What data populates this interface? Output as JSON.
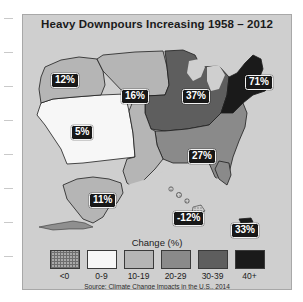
{
  "figure": {
    "title": "Heavy Downpours Increasing 1958 – 2012",
    "source": "Source: Climate Change Impacts in the U.S., 2014",
    "legend_title": "Change (%)",
    "panel_bg": "#cfcfcf"
  },
  "legend": {
    "bins": [
      {
        "label": "<0",
        "color": "#a9a9a9",
        "pattern": "stipple"
      },
      {
        "label": "0-9",
        "color": "#f7f7f7",
        "pattern": "solid"
      },
      {
        "label": "10-19",
        "color": "#b5b5b5",
        "pattern": "solid"
      },
      {
        "label": "20-29",
        "color": "#8a8a8a",
        "pattern": "solid"
      },
      {
        "label": "30-39",
        "color": "#5e5e5e",
        "pattern": "solid"
      },
      {
        "label": "40+",
        "color": "#1a1a1a",
        "pattern": "solid"
      }
    ]
  },
  "chart_data": {
    "type": "map",
    "title": "Heavy Downpours Increasing 1958 – 2012",
    "subtitle": "",
    "xlabel": "",
    "ylabel": "",
    "value_unit": "%",
    "value_label": "Change (%)",
    "legend_position": "bottom",
    "grid": false,
    "bins": [
      "<0",
      "0-9",
      "10-19",
      "20-29",
      "30-39",
      "40+"
    ],
    "bin_colors": [
      "#a9a9a9",
      "#f7f7f7",
      "#b5b5b5",
      "#8a8a8a",
      "#5e5e5e",
      "#1a1a1a"
    ],
    "categories": [
      "Northwest",
      "Northern Great Plains",
      "Southwest",
      "Midwest",
      "Northeast",
      "Southeast",
      "Southern Great Plains",
      "Alaska",
      "Hawaii",
      "Puerto Rico"
    ],
    "values": [
      12,
      16,
      5,
      37,
      71,
      27,
      15,
      11,
      -12,
      33
    ],
    "series": [
      {
        "name": "Change in very heavy precipitation, 1958-2012",
        "values": [
          12,
          16,
          5,
          37,
          71,
          27,
          15,
          11,
          -12,
          33
        ]
      }
    ]
  },
  "map_labels": [
    {
      "name": "northwest",
      "value": "12%",
      "x": 28,
      "y": 40
    },
    {
      "name": "great-plains-n",
      "value": "16%",
      "x": 98,
      "y": 56
    },
    {
      "name": "southwest",
      "value": "5%",
      "x": 48,
      "y": 92
    },
    {
      "name": "midwest",
      "value": "37%",
      "x": 159,
      "y": 56
    },
    {
      "name": "northeast",
      "value": "71%",
      "x": 224,
      "y": 42
    },
    {
      "name": "southeast",
      "value": "27%",
      "x": 165,
      "y": 118
    },
    {
      "name": "alaska",
      "value": "11%",
      "x": 66,
      "y": 166
    },
    {
      "name": "hawaii",
      "value": "-12%",
      "x": 156,
      "y": 184
    },
    {
      "name": "puerto-rico",
      "value": "33%",
      "x": 213,
      "y": 196
    }
  ]
}
